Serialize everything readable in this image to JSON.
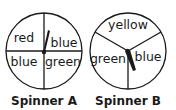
{
  "spinners": [
    {
      "name": "Spinner A",
      "sections": [
        {
          "label": "red",
          "position": "top-left"
        },
        {
          "label": "blue",
          "position": "top-right"
        },
        {
          "label": "blue",
          "position": "bottom-left"
        },
        {
          "label": "green",
          "position": "bottom-right"
        }
      ],
      "divisions": 4,
      "pointer": "pointing up, slightly right (into red/blue boundary)"
    },
    {
      "name": "Spinner B",
      "sections": [
        {
          "label": "yellow",
          "position": "top"
        },
        {
          "label": "green",
          "position": "left"
        },
        {
          "label": "blue",
          "position": "right"
        }
      ],
      "divisions": 3,
      "pointer": "pointing down, slightly right"
    }
  ],
  "colors": {
    "ink": "#1a1a1a",
    "background": "#ffffff"
  }
}
